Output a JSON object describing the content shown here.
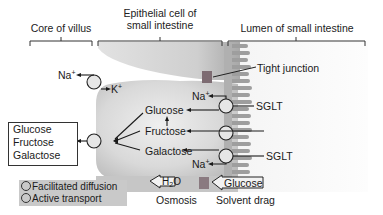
{
  "diagram": {
    "title_regions": {
      "core": "Core of villus",
      "epithelial_line1": "Epithelial cell of",
      "epithelial_line2": "small intestine",
      "lumen": "Lumen of small intestine"
    },
    "labels": {
      "tight_junction": "Tight junction",
      "sglt_top": "SGLT",
      "sglt_bottom": "SGLT",
      "na_top": "Na",
      "na_top_charge": "+",
      "na_bottom": "Na",
      "na_bottom_charge": "+",
      "na_pump": "Na",
      "na_pump_charge": "+",
      "k_pump": "K",
      "k_pump_charge": "+",
      "glucose": "Glucose",
      "fructose": "Fructose",
      "galactose": "Galactose"
    },
    "blood_box": {
      "items": [
        "Glucose",
        "Fructose",
        "Galactose"
      ]
    },
    "bottom": {
      "water_H": "H",
      "water_sub": "2",
      "water_O": "O",
      "osmosis": "Osmosis",
      "glucose_arrow": "Glucose",
      "solvent_drag": "Solvent drag"
    },
    "key": {
      "facilitated": "Facilitated diffusion",
      "active": "Active transport"
    },
    "colors": {
      "cell_fill": "#d4d4d4",
      "cell_light": "#e9e9e9",
      "microvilli": "#9a9a9a",
      "tight_junction": "#7a6a70",
      "key_bg": "#c9c9c9",
      "line": "#1a1a1a"
    }
  }
}
